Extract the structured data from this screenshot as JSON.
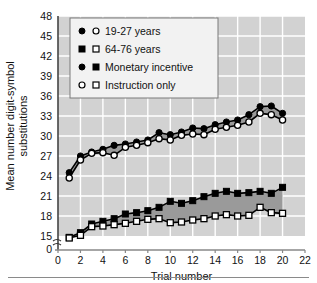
{
  "chart_data": {
    "type": "line",
    "title": "",
    "xlabel": "Trial number",
    "ylabel": "Mean number digit-symbol substitutions",
    "xlim": [
      0,
      22
    ],
    "ylim": [
      15,
      48
    ],
    "y_axis_break": true,
    "y_break_label": "0",
    "xticks": [
      0,
      2,
      4,
      6,
      8,
      10,
      12,
      14,
      16,
      18,
      20,
      22
    ],
    "yticks": [
      15,
      18,
      21,
      24,
      27,
      30,
      33,
      36,
      39,
      42,
      45,
      48
    ],
    "grid": true,
    "legend_position": "top-left",
    "x": [
      1,
      2,
      3,
      4,
      5,
      6,
      7,
      8,
      9,
      10,
      11,
      12,
      13,
      14,
      15,
      16,
      17,
      18,
      19,
      20
    ],
    "series": [
      {
        "name": "19-27 years, Monetary incentive",
        "marker": "filled-circle",
        "values": [
          24.5,
          27.0,
          27.6,
          28.0,
          28.6,
          28.8,
          29.1,
          29.4,
          30.5,
          30.2,
          30.6,
          31.2,
          31.1,
          31.7,
          32.1,
          32.4,
          33.2,
          34.4,
          34.5,
          33.4
        ]
      },
      {
        "name": "19-27 years, Instruction only",
        "marker": "open-circle",
        "values": [
          23.7,
          26.4,
          27.4,
          27.5,
          27.1,
          28.3,
          28.6,
          29.0,
          29.6,
          29.4,
          30.1,
          30.3,
          30.2,
          31.0,
          31.3,
          31.6,
          32.1,
          33.4,
          33.2,
          32.4
        ]
      },
      {
        "name": "64-76 years, Monetary incentive",
        "marker": "filled-square",
        "values": [
          14.8,
          15.5,
          16.8,
          17.2,
          17.6,
          18.3,
          18.5,
          18.8,
          19.3,
          20.2,
          19.9,
          20.3,
          20.9,
          21.4,
          21.7,
          21.4,
          21.5,
          21.7,
          21.4,
          22.3
        ]
      },
      {
        "name": "64-76 years, Instruction only",
        "marker": "open-square",
        "values": [
          14.7,
          15.1,
          16.4,
          16.5,
          16.7,
          16.9,
          17.2,
          17.5,
          17.6,
          17.0,
          17.1,
          17.4,
          17.6,
          18.0,
          18.2,
          18.0,
          18.1,
          19.3,
          18.5,
          18.4
        ]
      }
    ],
    "legend": [
      {
        "marker_left": "filled-circle",
        "marker_right": "open-circle",
        "label": "19-27 years"
      },
      {
        "marker_left": "filled-square",
        "marker_right": "open-square",
        "label": "64-76 years"
      },
      {
        "marker_left": "filled-circle",
        "marker_right": "filled-square",
        "label": "Monetary incentive"
      },
      {
        "marker_left": "open-circle",
        "marker_right": "open-square",
        "label": "Instruction only"
      }
    ],
    "colors": {
      "plot_background": "#d2d2d2",
      "gridline": "#ffffff",
      "band_fill": "#9a9a9a",
      "line": "#000000",
      "marker_fill": "#000000",
      "marker_open": "#ffffff",
      "legend_background": "#f2f2f2",
      "text": "#111111"
    }
  }
}
